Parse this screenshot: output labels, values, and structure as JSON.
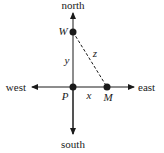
{
  "diagram": {
    "directions": {
      "north": "north",
      "south": "south",
      "east": "east",
      "west": "west"
    },
    "points": {
      "W": "W",
      "P": "P",
      "M": "M"
    },
    "segments": {
      "x": "x",
      "y": "y",
      "z": "z"
    },
    "colors": {
      "ink": "#1a1a1a",
      "background": "#ffffff"
    }
  }
}
